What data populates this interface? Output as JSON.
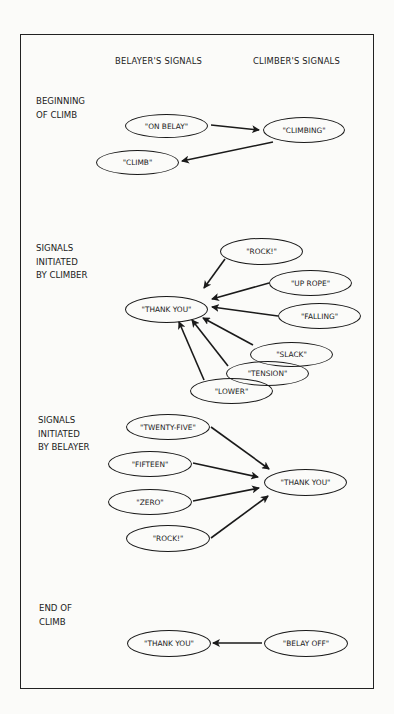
{
  "columns": {
    "belayer": "BELAYER'S SIGNALS",
    "climber": "CLIMBER'S SIGNALS"
  },
  "sections": [
    {
      "title": "BEGINNING\nOF CLIMB",
      "nodes": [
        "\"ON BELAY\"",
        "\"CLIMBING\"",
        "\"CLIMB\""
      ]
    },
    {
      "title": "SIGNALS\nINITIATED\nBY CLIMBER",
      "nodes": [
        "\"THANK YOU\"",
        "\"ROCK!\"",
        "\"UP ROPE\"",
        "\"FALLING\"",
        "\"SLACK\"",
        "\"TENSION\"",
        "\"LOWER\""
      ]
    },
    {
      "title": "SIGNALS\nINITIATED\nBY BELAYER",
      "nodes": [
        "\"TWENTY-FIVE\"",
        "\"FIFTEEN\"",
        "\"ZERO\"",
        "\"ROCK!\"",
        "\"THANK YOU\""
      ]
    },
    {
      "title": "END OF\nCLIMB",
      "nodes": [
        "\"THANK YOU\"",
        "\"BELAY OFF\""
      ]
    }
  ],
  "edges": [
    {
      "from": "\"ON BELAY\"",
      "to": "\"CLIMBING\""
    },
    {
      "from": "\"CLIMBING\"",
      "to": "\"CLIMB\""
    },
    {
      "from": "\"ROCK!\"",
      "to": "\"THANK YOU\""
    },
    {
      "from": "\"UP ROPE\"",
      "to": "\"THANK YOU\""
    },
    {
      "from": "\"FALLING\"",
      "to": "\"THANK YOU\""
    },
    {
      "from": "\"SLACK\"",
      "to": "\"THANK YOU\""
    },
    {
      "from": "\"TENSION\"",
      "to": "\"THANK YOU\""
    },
    {
      "from": "\"LOWER\"",
      "to": "\"THANK YOU\""
    },
    {
      "from": "\"TWENTY-FIVE\"",
      "to": "\"THANK YOU\""
    },
    {
      "from": "\"FIFTEEN\"",
      "to": "\"THANK YOU\""
    },
    {
      "from": "\"ZERO\"",
      "to": "\"THANK YOU\""
    },
    {
      "from": "\"ROCK!\"",
      "to": "\"THANK YOU\""
    },
    {
      "from": "\"BELAY OFF\"",
      "to": "\"THANK YOU\""
    }
  ]
}
